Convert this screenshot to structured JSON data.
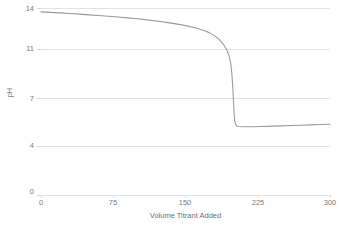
{
  "chart_data": {
    "type": "line",
    "title": "Titration Curve for 0.1 M Strong Base with Strong Acid Titrant",
    "xlabel": "Volume Titrant Added",
    "ylabel": "pH",
    "xlim": [
      0,
      300
    ],
    "ylim": [
      0,
      14
    ],
    "xticks": [
      0,
      75,
      150,
      225,
      300
    ],
    "yticks": [
      0,
      4,
      7,
      11,
      14
    ],
    "ytick_labels": [
      "0",
      "4",
      "7",
      "11",
      "14"
    ],
    "xtick_labels": [
      "0",
      "75",
      "150",
      "225",
      "300"
    ],
    "grid": true,
    "grid_axis": "y",
    "legend": false,
    "series": [
      {
        "name": "pH",
        "color": "#9a9a9a",
        "x": [
          0,
          10,
          20,
          30,
          40,
          50,
          60,
          70,
          80,
          90,
          100,
          110,
          120,
          130,
          140,
          150,
          160,
          170,
          175,
          180,
          185,
          190,
          193,
          195,
          196,
          197,
          198,
          199,
          200,
          200.5,
          201,
          202,
          203,
          205,
          210,
          220,
          230,
          240,
          250,
          260,
          270,
          280,
          290,
          300
        ],
        "y": [
          13.72,
          13.68,
          13.64,
          13.6,
          13.55,
          13.5,
          13.45,
          13.4,
          13.34,
          13.28,
          13.21,
          13.13,
          13.05,
          12.95,
          12.84,
          12.71,
          12.55,
          12.33,
          12.18,
          11.98,
          11.7,
          11.28,
          10.9,
          10.5,
          10.2,
          9.8,
          9.1,
          8.0,
          6.6,
          6.0,
          5.6,
          5.35,
          5.26,
          5.22,
          5.2,
          5.2,
          5.22,
          5.24,
          5.26,
          5.28,
          5.3,
          5.32,
          5.34,
          5.36
        ]
      }
    ]
  },
  "axes": {
    "y_title": "pH",
    "x_title": "Volume Titrant Added"
  }
}
